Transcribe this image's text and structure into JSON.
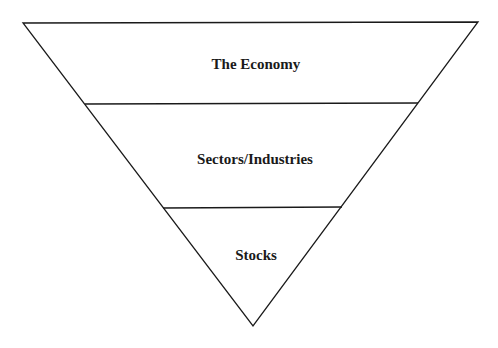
{
  "diagram": {
    "type": "inverted-pyramid",
    "layers": [
      {
        "label": "The Economy"
      },
      {
        "label": "Sectors/Industries"
      },
      {
        "label": "Stocks"
      }
    ],
    "colors": {
      "stroke": "#1a1a1a",
      "fill": "#ffffff",
      "text": "#1a1a1a"
    }
  }
}
